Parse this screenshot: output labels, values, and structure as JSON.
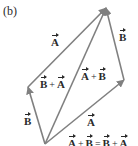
{
  "figure": {
    "part_label": "(b)",
    "colors": {
      "arrow": "#808080",
      "text": "#2a2a2a",
      "background": "#ffffff"
    },
    "vertices": {
      "origin": [
        45,
        144
      ],
      "left": [
        28,
        87
      ],
      "right": [
        124,
        80
      ],
      "top": [
        106,
        8
      ]
    },
    "vectors": [
      {
        "name": "B",
        "from": "origin",
        "to": "left"
      },
      {
        "name": "A",
        "from": "left",
        "to": "top"
      },
      {
        "name": "A+B",
        "from": "origin",
        "to": "top"
      },
      {
        "name": "A",
        "from": "origin",
        "to": "right"
      },
      {
        "name": "B",
        "from": "right",
        "to": "top"
      }
    ],
    "labels": {
      "a_top_left": "A",
      "b_top_right": "B",
      "a_plus_b": {
        "first": "A",
        "op": "+",
        "second": "B"
      },
      "b_plus_a": {
        "first": "B",
        "op": "+",
        "second": "A"
      },
      "b_left": "B",
      "a_lower_right": "A",
      "equation": {
        "t1": "A",
        "op1": "+",
        "t2": "B",
        "eq": "=",
        "t3": "B",
        "op2": "+",
        "t4": "A"
      }
    }
  }
}
